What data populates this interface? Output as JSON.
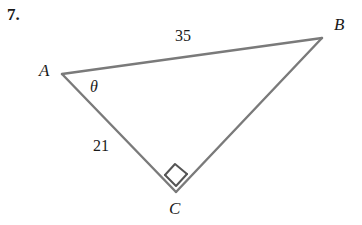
{
  "problem": {
    "number": "7."
  },
  "figure": {
    "kind": "right-triangle-diagram",
    "stroke_color": "#7a7a7a",
    "background_color": "#ffffff",
    "text_color": "#1a1a1a",
    "vertices": [
      {
        "name": "A",
        "label": "A",
        "x": 62,
        "y": 74
      },
      {
        "name": "B",
        "label": "B",
        "x": 322,
        "y": 38
      },
      {
        "name": "C",
        "label": "C",
        "x": 176,
        "y": 192
      }
    ],
    "sides": [
      {
        "name": "AB",
        "label": "35",
        "from": "A",
        "to": "B"
      },
      {
        "name": "AC",
        "label": "21",
        "from": "A",
        "to": "C"
      },
      {
        "name": "BC",
        "label": "",
        "from": "B",
        "to": "C"
      }
    ],
    "angles": [
      {
        "name": "A",
        "label": "θ",
        "vertex": "A",
        "marker": "none"
      },
      {
        "name": "C",
        "label": "",
        "vertex": "C",
        "marker": "right-angle-square"
      }
    ]
  }
}
